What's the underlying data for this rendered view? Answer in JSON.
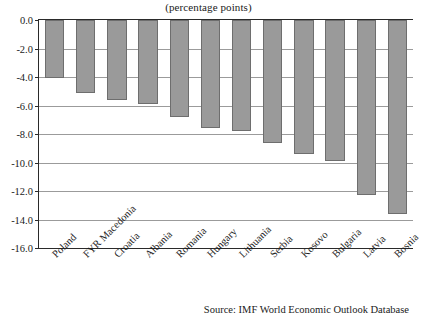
{
  "chart_data": {
    "type": "bar",
    "title": "",
    "subtitle": "(percentage points)",
    "xlabel": "",
    "ylabel": "",
    "ylim": [
      -16.0,
      0.0
    ],
    "ytick_labels": [
      "0.0",
      "-2.0",
      "-4.0",
      "-6.0",
      "-8.0",
      "-10.0",
      "-12.0",
      "-14.0",
      "-16.0"
    ],
    "ytick_values": [
      0.0,
      -2.0,
      -4.0,
      -6.0,
      -8.0,
      -10.0,
      -12.0,
      -14.0,
      -16.0
    ],
    "grid": true,
    "legend": "none",
    "orientation": "vertical",
    "bar_color": "#9a9a9a",
    "bar_edge_color": "#6e6e6e",
    "categories": [
      "Poland",
      "FYR Macedonia",
      "Croatia",
      "Albania",
      "Romania",
      "Hungary",
      "Lithuania",
      "Serbia",
      "Kosovo",
      "Bulgaria",
      "Latvia",
      "Bosnia"
    ],
    "values": [
      -4.1,
      -5.1,
      -5.6,
      -5.9,
      -6.8,
      -7.6,
      -7.8,
      -8.6,
      -9.4,
      -9.9,
      -12.3,
      -13.6
    ]
  },
  "source": {
    "text": "Source: IMF World Economic Outlook Database"
  }
}
